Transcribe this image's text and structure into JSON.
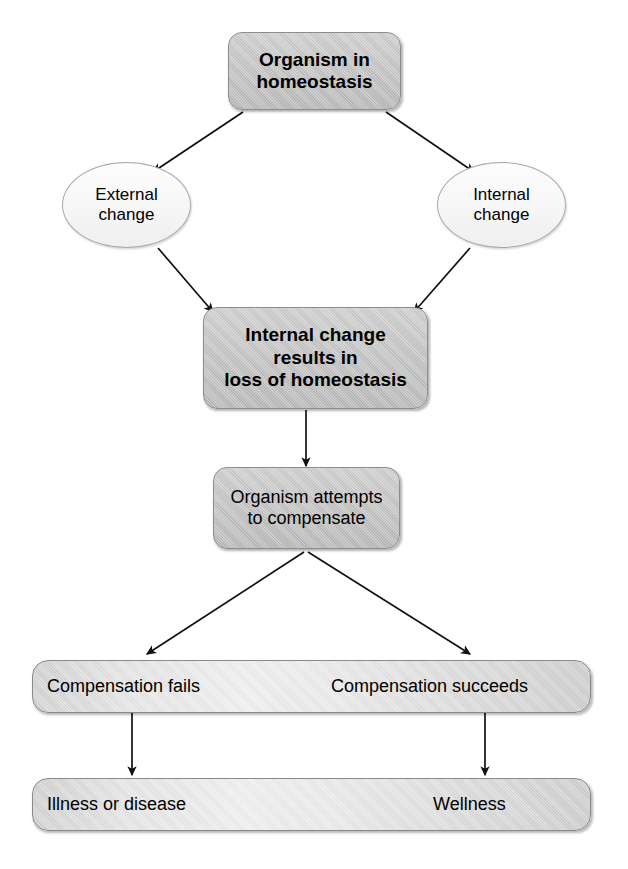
{
  "diagram": {
    "colors": {
      "box_fill_dark": "#c8c8c8",
      "box_fill_light": "#d6d6d6",
      "ellipse_fill": "#f7f7f7",
      "bar_fill": "#e6e6e6",
      "outline": "#8d8d8d",
      "arrow": "#111111",
      "text": "#000000",
      "background": "#ffffff"
    },
    "nodes": {
      "organism_homeostasis": {
        "label": "Organism in homeostasis",
        "line1": "Organism in",
        "line2": "homeostasis",
        "shape": "rounded-rect",
        "emphasis": "bold"
      },
      "external_change": {
        "label": "External change",
        "line1": "External",
        "line2": "change",
        "shape": "ellipse",
        "emphasis": "regular"
      },
      "internal_change": {
        "label": "Internal change",
        "line1": "Internal",
        "line2": "change",
        "shape": "ellipse",
        "emphasis": "regular"
      },
      "loss_of_homeostasis": {
        "label": "Internal change results in loss of homeostasis",
        "line1": "Internal change",
        "line2": "results in",
        "line3": "loss of homeostasis",
        "shape": "rounded-rect",
        "emphasis": "bold"
      },
      "attempts_compensate": {
        "label": "Organism attempts to compensate",
        "line1": "Organism attempts",
        "line2": "to compensate",
        "shape": "rounded-rect",
        "emphasis": "regular"
      },
      "compensation_bar": {
        "shape": "pill-bar",
        "left_label": "Compensation fails",
        "right_label": "Compensation succeeds"
      },
      "outcome_bar": {
        "shape": "pill-bar",
        "left_label": "Illness or disease",
        "right_label": "Wellness"
      }
    },
    "edges": [
      {
        "name": "homeostasis-to-external-change",
        "from": "organism_homeostasis",
        "to": "external_change",
        "style": "arrow"
      },
      {
        "name": "homeostasis-to-internal-change",
        "from": "organism_homeostasis",
        "to": "internal_change",
        "style": "arrow"
      },
      {
        "name": "external-change-to-loss",
        "from": "external_change",
        "to": "loss_of_homeostasis",
        "style": "arrow"
      },
      {
        "name": "internal-change-to-loss",
        "from": "internal_change",
        "to": "loss_of_homeostasis",
        "style": "arrow"
      },
      {
        "name": "loss-to-compensate",
        "from": "loss_of_homeostasis",
        "to": "attempts_compensate",
        "style": "arrow"
      },
      {
        "name": "compensate-to-fails",
        "from": "attempts_compensate",
        "to": "compensation_bar_left",
        "style": "arrow"
      },
      {
        "name": "compensate-to-succeeds",
        "from": "attempts_compensate",
        "to": "compensation_bar_right",
        "style": "arrow"
      },
      {
        "name": "fails-to-illness",
        "from": "compensation_bar_left",
        "to": "outcome_bar_left",
        "style": "arrow"
      },
      {
        "name": "succeeds-to-wellness",
        "from": "compensation_bar_right",
        "to": "outcome_bar_right",
        "style": "arrow"
      }
    ]
  }
}
